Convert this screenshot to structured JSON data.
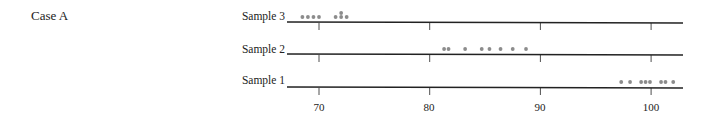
{
  "case_label": "Case A",
  "chart_data": {
    "type": "scatter",
    "subtype": "dot-plot",
    "title": "Case A",
    "xlabel": "",
    "ylabel": "",
    "xlim": [
      67.5,
      103
    ],
    "x_ticks": [
      70,
      80,
      90,
      100
    ],
    "x_tick_labels": [
      "70",
      "80",
      "90",
      "100"
    ],
    "grid": false,
    "legend": null,
    "series": [
      {
        "name": "Sample 3",
        "values": [
          68.5,
          69,
          69.5,
          70,
          71.5,
          72,
          72,
          72.5
        ]
      },
      {
        "name": "Sample 2",
        "values": [
          81.3,
          81.7,
          83.2,
          84.7,
          85.4,
          86.4,
          87.5,
          88.7
        ]
      },
      {
        "name": "Sample 1",
        "values": [
          97.3,
          98.1,
          99.1,
          99.5,
          99.9,
          100.9,
          101.3,
          102
        ]
      }
    ],
    "dot_color": "#8c8c8c",
    "axis_color": "#222222"
  },
  "samples": [
    {
      "label": "Sample 3"
    },
    {
      "label": "Sample 2"
    },
    {
      "label": "Sample 1"
    }
  ],
  "ticks": [
    "70",
    "80",
    "90",
    "100"
  ]
}
